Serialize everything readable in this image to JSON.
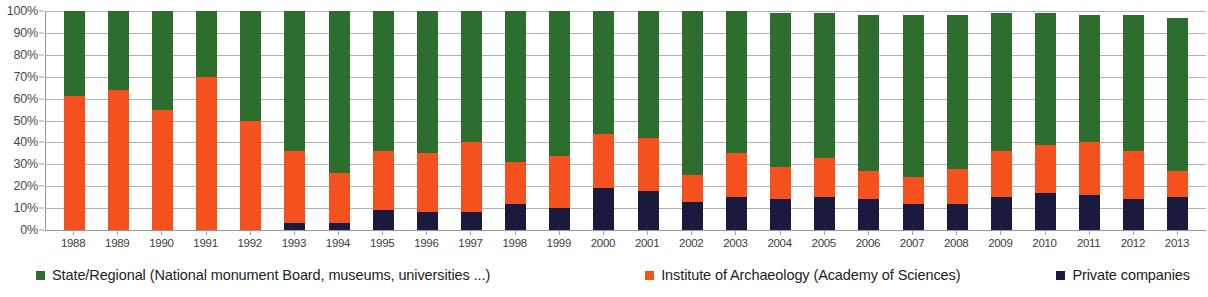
{
  "chart_data": {
    "type": "bar",
    "subtype": "stacked-percentage-column",
    "title": "",
    "xlabel": "",
    "ylabel": "",
    "ylim": [
      0,
      100
    ],
    "ytick_labels": [
      "0%",
      "10%",
      "20%",
      "30%",
      "40%",
      "50%",
      "60%",
      "70%",
      "80%",
      "90%",
      "100%"
    ],
    "ytick_values": [
      0,
      10,
      20,
      30,
      40,
      50,
      60,
      70,
      80,
      90,
      100
    ],
    "grid": true,
    "legend_position": "bottom",
    "categories": [
      "1988",
      "1989",
      "1990",
      "1991",
      "1992",
      "1993",
      "1994",
      "1995",
      "1996",
      "1997",
      "1998",
      "1999",
      "2000",
      "2001",
      "2002",
      "2003",
      "2004",
      "2005",
      "2006",
      "2007",
      "2008",
      "2009",
      "2010",
      "2011",
      "2012",
      "2013"
    ],
    "series": [
      {
        "name": "State/Regional (National monument Board, museums, universities ...)",
        "short_name": "State/Regional",
        "color": "#2d6e2f",
        "stack_order": 3,
        "values": [
          39,
          36,
          45,
          30,
          50,
          64,
          74,
          64,
          65,
          60,
          69,
          66,
          56,
          58,
          75,
          65,
          70,
          66,
          71,
          74,
          70,
          63,
          60,
          58,
          62,
          70
        ]
      },
      {
        "name": "Institute of Archaeology  (Academy of Sciences)",
        "short_name": "Institute of Archaeology",
        "color": "#f4511e",
        "stack_order": 2,
        "values": [
          61,
          64,
          55,
          70,
          50,
          33,
          23,
          27,
          27,
          32,
          19,
          24,
          25,
          24,
          12,
          20,
          15,
          18,
          13,
          12,
          16,
          21,
          22,
          24,
          22,
          12
        ]
      },
      {
        "name": "Private companies",
        "short_name": "Private companies",
        "color": "#191a3d",
        "stack_order": 1,
        "values": [
          0,
          0,
          0,
          0,
          0,
          3,
          3,
          9,
          8,
          8,
          12,
          10,
          19,
          18,
          13,
          15,
          14,
          15,
          14,
          12,
          12,
          15,
          17,
          16,
          14,
          15
        ]
      }
    ]
  },
  "legend": {
    "items": [
      {
        "label": "State/Regional (National monument Board, museums, universities ...)",
        "color": "#2d6e2f"
      },
      {
        "label": "Institute of Archaeology  (Academy of Sciences)",
        "color": "#f4511e"
      },
      {
        "label": "Private companies",
        "color": "#191a3d"
      }
    ]
  },
  "colors": {
    "state": "#2d6e2f",
    "institute": "#f4511e",
    "private": "#191a3d",
    "grid": "#a9b2ba",
    "axis": "#8d9aa5",
    "background": "#ffffff"
  }
}
